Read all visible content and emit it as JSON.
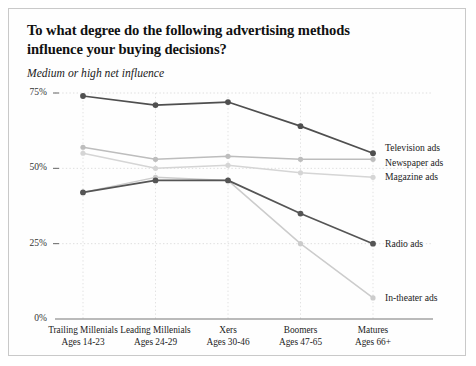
{
  "chart_data": {
    "type": "line",
    "title": "To what degree do the following advertising methods influence your buying decisions?",
    "title_line1": "To what degree do the following advertising methods",
    "title_line2": "influence your buying decisions?",
    "subtitle": "Medium or high net influence",
    "xlabel": "",
    "ylabel": "",
    "ylim": [
      0,
      75
    ],
    "yticks": [
      0,
      25,
      50,
      75
    ],
    "ytick_labels": [
      "0%",
      "25%",
      "50%",
      "75%"
    ],
    "grid": true,
    "legend_position": "right-of-plot-inline",
    "categories": [
      "Trailing Millenials",
      "Leading Millenials",
      "Xers",
      "Boomers",
      "Matures"
    ],
    "category_sublabels": [
      "Ages 14-23",
      "Ages 24-29",
      "Ages 30-46",
      "Ages 47-65",
      "Ages 66+"
    ],
    "series": [
      {
        "name": "Television ads",
        "color": "#4f4f4f",
        "values": [
          74,
          71,
          72,
          64,
          55
        ]
      },
      {
        "name": "Newspaper ads",
        "color": "#bdbdbd",
        "values": [
          57,
          53,
          54,
          53,
          53
        ]
      },
      {
        "name": "Magazine ads",
        "color": "#d5d5d5",
        "values": [
          55,
          50,
          51,
          48.5,
          47
        ]
      },
      {
        "name": "Radio ads",
        "color": "#555555",
        "values": [
          42,
          46,
          46,
          35,
          25
        ]
      },
      {
        "name": "In-theater ads",
        "color": "#cccccc",
        "values": [
          42,
          47,
          46,
          25,
          7
        ]
      }
    ]
  },
  "xticks_labels": {
    "c0": "Trailing Millenials",
    "c0s": "Ages 14-23",
    "c1": "Leading Millenials",
    "c1s": "Ages 24-29",
    "c2": "Xers",
    "c2s": "Ages 30-46",
    "c3": "Boomers",
    "c3s": "Ages 47-65",
    "c4": "Matures",
    "c4s": "Ages 66+"
  }
}
